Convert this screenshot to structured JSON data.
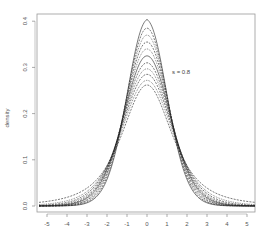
{
  "chart_data": {
    "type": "line",
    "title": "",
    "xlabel": "",
    "ylabel": "density",
    "xlim": [
      -5.5,
      5.4
    ],
    "ylim": [
      -0.01,
      0.42
    ],
    "x_ticks": [
      -5,
      -4,
      -3,
      -2,
      -1,
      0,
      1,
      2,
      3,
      4,
      5
    ],
    "x_tick_labels": [
      "-5",
      "-4",
      "-3",
      "-2",
      "-1",
      "0",
      "1",
      "2",
      "3",
      "4",
      "5"
    ],
    "y_ticks": [
      0.0,
      0.1,
      0.2,
      0.3,
      0.4
    ],
    "y_tick_labels": [
      "0.0",
      "0.1",
      "0.2",
      "0.3",
      "0.4"
    ],
    "grid": false,
    "legend": null,
    "annotations": [
      {
        "text": "s = 0.8",
        "x": 1.25,
        "y": 0.285
      }
    ],
    "series": [
      {
        "name": "curve-1",
        "peak": 0.4,
        "tail": 0.008,
        "style": "solid"
      },
      {
        "name": "curve-2",
        "peak": 0.385,
        "tail": 0.009,
        "style": "dashed"
      },
      {
        "name": "curve-3",
        "peak": 0.37,
        "tail": 0.01,
        "style": "dotted"
      },
      {
        "name": "curve-4",
        "peak": 0.355,
        "tail": 0.011,
        "style": "dashed"
      },
      {
        "name": "curve-5",
        "peak": 0.34,
        "tail": 0.012,
        "style": "dotted"
      },
      {
        "name": "curve-6",
        "peak": 0.325,
        "tail": 0.013,
        "style": "solid"
      },
      {
        "name": "curve-7",
        "peak": 0.31,
        "tail": 0.014,
        "style": "dashed"
      },
      {
        "name": "curve-8",
        "peak": 0.297,
        "tail": 0.015,
        "style": "dotted"
      },
      {
        "name": "curve-9",
        "peak": 0.285,
        "tail": 0.016,
        "style": "dashed"
      },
      {
        "name": "curve-10",
        "peak": 0.272,
        "tail": 0.018,
        "style": "dotted"
      },
      {
        "name": "curve-11",
        "peak": 0.262,
        "tail": 0.02,
        "style": "dashed"
      }
    ],
    "x": [
      -5.4,
      -5,
      -4.5,
      -4,
      -3.5,
      -3,
      -2.5,
      -2,
      -1.6,
      -1.2,
      -0.8,
      -0.4,
      0,
      0.4,
      0.8,
      1.2,
      1.6,
      2,
      2.5,
      3,
      3.5,
      4,
      4.5,
      5,
      5.4
    ]
  },
  "plot": {
    "left_px": 37,
    "right_px": 255,
    "top_px": 14,
    "bottom_px": 212,
    "x0_px": 147,
    "px_per_x": 20,
    "y0_px": 206,
    "px_per_y": 462,
    "line_color": "#222222",
    "axis_color": "#888888"
  }
}
